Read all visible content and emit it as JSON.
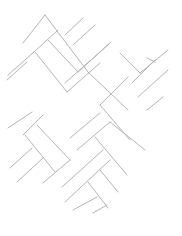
{
  "diagram": {
    "title": "Herringbone pattern line drawing",
    "stroke_color": "#b4b4b4",
    "background_color": "#ffffff",
    "segments": [
      [
        45,
        15,
        23,
        43
      ],
      [
        45,
        15,
        88,
        72
      ],
      [
        83,
        18,
        65,
        35
      ],
      [
        95,
        25,
        73,
        45
      ],
      [
        58,
        30,
        34,
        52
      ],
      [
        48,
        40,
        78,
        72
      ],
      [
        110,
        43,
        65,
        83
      ],
      [
        35,
        52,
        67,
        92
      ],
      [
        120,
        53,
        140,
        73
      ],
      [
        147,
        58,
        155,
        62
      ],
      [
        155,
        60,
        132,
        83
      ],
      [
        168,
        70,
        138,
        97
      ],
      [
        163,
        97,
        147,
        110
      ],
      [
        34,
        52,
        8,
        75
      ],
      [
        27,
        62,
        7,
        80
      ],
      [
        32,
        112,
        8,
        128
      ],
      [
        43,
        115,
        23,
        135
      ],
      [
        37,
        125,
        70,
        160
      ],
      [
        25,
        135,
        55,
        172
      ],
      [
        100,
        113,
        70,
        138
      ],
      [
        110,
        122,
        77,
        150
      ],
      [
        95,
        137,
        127,
        175
      ],
      [
        110,
        122,
        145,
        150
      ],
      [
        70,
        160,
        43,
        183
      ],
      [
        103,
        150,
        62,
        187
      ],
      [
        110,
        160,
        65,
        202
      ],
      [
        100,
        170,
        118,
        192
      ],
      [
        88,
        182,
        108,
        208
      ],
      [
        97,
        197,
        73,
        210
      ],
      [
        107,
        205,
        93,
        213
      ],
      [
        32,
        148,
        10,
        168
      ],
      [
        43,
        158,
        17,
        182
      ],
      [
        78,
        72,
        110,
        43
      ],
      [
        67,
        92,
        100,
        63
      ],
      [
        128,
        77,
        100,
        105
      ],
      [
        140,
        73,
        168,
        50
      ],
      [
        88,
        72,
        128,
        110
      ],
      [
        100,
        105,
        130,
        140
      ]
    ]
  }
}
